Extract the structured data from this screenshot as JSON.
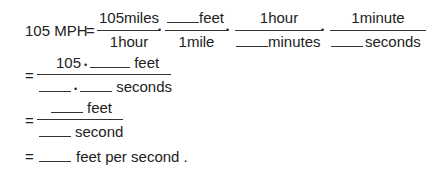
{
  "line1": {
    "lhs": "105 MPH",
    "eq": "=",
    "f1": {
      "num": "105miles",
      "den": "1hour"
    },
    "f2": {
      "num_unit": "feet",
      "den": "1mile"
    },
    "f3": {
      "num": "1hour",
      "den_unit": "minutes"
    },
    "f4": {
      "num": "1minute",
      "den_unit": "seconds"
    },
    "dot": "•"
  },
  "line2": {
    "eq": "=",
    "num_prefix": "105",
    "dot": "•",
    "num_unit": "feet",
    "den_unit": "seconds"
  },
  "line3": {
    "eq": "=",
    "num_unit": "feet",
    "den_unit": "second"
  },
  "line4": {
    "eq": "=",
    "suffix": "feet per second ."
  }
}
